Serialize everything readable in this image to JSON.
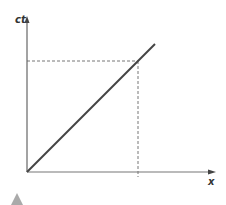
{
  "diagram": {
    "type": "spacetime-diagram",
    "axes": {
      "vertical_label": "ct",
      "horizontal_label": "x"
    },
    "colors": {
      "axis": "#666666",
      "worldline": "#444444",
      "dashed": "#777777",
      "triangle": "#aaaaaa",
      "label": "#333333"
    },
    "geometry": {
      "origin": [
        27,
        172
      ],
      "y_axis_top": [
        27,
        17
      ],
      "x_axis_right": [
        215,
        172
      ],
      "worldline_end": [
        155,
        44
      ],
      "projection_point": [
        138,
        61
      ],
      "x_tick_bottom": 177
    },
    "decorations": {
      "bottom_left_marker": "gray-triangle"
    }
  }
}
